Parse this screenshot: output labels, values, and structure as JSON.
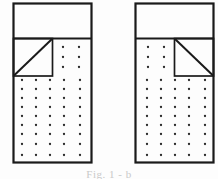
{
  "figure": {
    "kind": "technical-line-drawing",
    "background_color": "#fdfdfd",
    "line_color": "#1a1a1a",
    "dot_color": "#2b2b2b",
    "canvas": {
      "width": 218,
      "height": 179
    },
    "caption": {
      "text": "Fig. 1 - b",
      "visible": "partially cropped at bottom edge",
      "color": "#c9c9c9"
    },
    "panels": [
      {
        "id": "left-panel",
        "label": "left figure",
        "outer_rect": {
          "x": 13,
          "y": 3,
          "width": 79,
          "height": 160
        },
        "divider_y": 38,
        "blank_band": {
          "x": 13,
          "y": 3,
          "width": 79,
          "height": 35
        },
        "triangle_square": {
          "x": 13,
          "y": 38,
          "width": 39,
          "height": 38,
          "diagonal": "bottom-left-to-top-right",
          "corner": "left"
        },
        "upper_dots": {
          "rows": 3,
          "cols": 2,
          "region": "right of square"
        },
        "lower_dots": {
          "rows": 9,
          "cols": 5,
          "region": "below divider"
        }
      },
      {
        "id": "right-panel",
        "label": "right figure",
        "outer_rect": {
          "x": 135,
          "y": 3,
          "width": 79,
          "height": 160
        },
        "divider_y": 38,
        "blank_band": {
          "x": 135,
          "y": 3,
          "width": 79,
          "height": 35
        },
        "triangle_square": {
          "x": 175,
          "y": 38,
          "width": 39,
          "height": 38,
          "diagonal": "top-left-to-bottom-right",
          "corner": "right"
        },
        "upper_dots": {
          "rows": 3,
          "cols": 2,
          "region": "left of square"
        },
        "lower_dots": {
          "rows": 9,
          "cols": 5,
          "region": "below divider"
        }
      }
    ]
  }
}
